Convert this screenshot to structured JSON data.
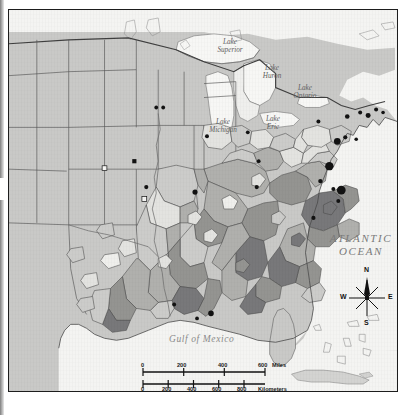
{
  "map": {
    "title": "United States distribution map",
    "type": "choropleth-with-point-symbols",
    "region": "Eastern and Central United States",
    "water_labels": [
      {
        "name": "Lake Superior",
        "line1": "Lake",
        "line2": "Superior",
        "x": 220,
        "y": 33
      },
      {
        "name": "Lake Huron",
        "line1": "Lake",
        "line2": "Huron",
        "x": 262,
        "y": 59
      },
      {
        "name": "Lake Ontario",
        "line1": "Lake",
        "line2": "Ontario",
        "x": 294,
        "y": 79
      },
      {
        "name": "Lake Michigan",
        "line1": "Lake",
        "line2": "Michigan",
        "x": 213,
        "y": 113
      },
      {
        "name": "Lake Erie",
        "line1": "Lake",
        "line2": "Erie",
        "x": 264,
        "y": 110
      }
    ],
    "ocean_label": {
      "line1": "ATLANTIC",
      "line2": "OCEAN",
      "x": 350,
      "y": 229
    },
    "gulf_label": {
      "text": "Gulf of Mexico",
      "x": 217,
      "y": 332
    }
  },
  "compass": {
    "north": "N",
    "east": "E",
    "south": "S",
    "west": "W"
  },
  "scalebar": {
    "miles": {
      "ticks": [
        "0",
        "200",
        "400",
        "600"
      ],
      "unit": "Miles"
    },
    "kilometers": {
      "ticks": [
        "0",
        "200",
        "400",
        "600",
        "800"
      ],
      "unit": "Kilometers"
    }
  },
  "legend_shades": {
    "background_land": "#c9c9c7",
    "water": "#f4f4f2",
    "class_lightest": "#e3e3e0",
    "class_light": "#cccccA",
    "class_medium": "#b0b0ad",
    "class_dark": "#949491",
    "class_darkest": "#78787a",
    "outline": "#4a4a4a",
    "frame": "#1d1d1d",
    "symbol": "#121212"
  },
  "chart_data": {
    "type": "map",
    "shade_classes": [
      {
        "label": "lightest",
        "color": "#e3e3e0"
      },
      {
        "label": "light",
        "color": "#ccccca"
      },
      {
        "label": "medium",
        "color": "#b0b0ad"
      },
      {
        "label": "dark",
        "color": "#949491"
      },
      {
        "label": "darkest",
        "color": "#78787a"
      }
    ],
    "point_symbols": [
      {
        "x": 148,
        "y": 98,
        "r": 1.9,
        "type": "filled-circle"
      },
      {
        "x": 155,
        "y": 98,
        "r": 1.9,
        "type": "filled-circle"
      },
      {
        "x": 126,
        "y": 152,
        "r": 2.1,
        "type": "filled-square"
      },
      {
        "x": 96,
        "y": 159,
        "r": 2.4,
        "type": "open-square"
      },
      {
        "x": 138,
        "y": 178,
        "r": 2.1,
        "type": "filled-circle"
      },
      {
        "x": 136,
        "y": 190,
        "r": 2.4,
        "type": "open-square"
      },
      {
        "x": 187,
        "y": 183,
        "r": 2.6,
        "type": "filled-circle"
      },
      {
        "x": 199,
        "y": 127,
        "r": 2.0,
        "type": "filled-circle"
      },
      {
        "x": 240,
        "y": 123,
        "r": 1.9,
        "type": "filled-circle"
      },
      {
        "x": 249,
        "y": 178,
        "r": 2.1,
        "type": "filled-circle"
      },
      {
        "x": 251,
        "y": 152,
        "r": 1.9,
        "type": "filled-circle"
      },
      {
        "x": 311,
        "y": 112,
        "r": 2.0,
        "type": "filled-circle"
      },
      {
        "x": 340,
        "y": 107,
        "r": 2.3,
        "type": "filled-circle"
      },
      {
        "x": 353,
        "y": 103,
        "r": 2.0,
        "type": "filled-circle"
      },
      {
        "x": 361,
        "y": 106,
        "r": 2.5,
        "type": "filled-circle"
      },
      {
        "x": 369,
        "y": 100,
        "r": 2.0,
        "type": "filled-circle"
      },
      {
        "x": 376,
        "y": 103,
        "r": 1.8,
        "type": "filled-circle"
      },
      {
        "x": 330,
        "y": 132,
        "r": 3.4,
        "type": "filled-circle"
      },
      {
        "x": 338,
        "y": 128,
        "r": 2.1,
        "type": "filled-circle"
      },
      {
        "x": 349,
        "y": 130,
        "r": 1.8,
        "type": "filled-circle"
      },
      {
        "x": 322,
        "y": 157,
        "r": 4.2,
        "type": "filled-circle"
      },
      {
        "x": 313,
        "y": 172,
        "r": 2.2,
        "type": "filled-circle"
      },
      {
        "x": 326,
        "y": 180,
        "r": 2.0,
        "type": "filled-circle"
      },
      {
        "x": 334,
        "y": 181,
        "r": 4.4,
        "type": "filled-circle"
      },
      {
        "x": 331,
        "y": 192,
        "r": 2.0,
        "type": "filled-circle"
      },
      {
        "x": 306,
        "y": 209,
        "r": 2.1,
        "type": "filled-circle"
      },
      {
        "x": 203,
        "y": 305,
        "r": 2.8,
        "type": "filled-circle"
      },
      {
        "x": 166,
        "y": 296,
        "r": 2.0,
        "type": "filled-circle"
      },
      {
        "x": 189,
        "y": 310,
        "r": 1.9,
        "type": "filled-circle"
      }
    ]
  }
}
